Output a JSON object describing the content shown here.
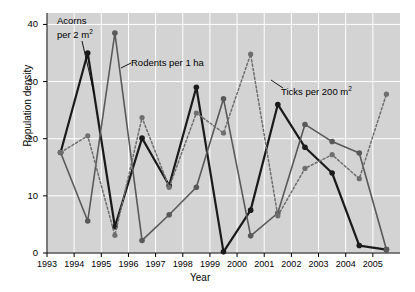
{
  "chart_data": {
    "type": "line",
    "title": "",
    "xlabel": "Year",
    "ylabel": "Population density",
    "xlim": [
      1993,
      2006
    ],
    "ylim": [
      0,
      42
    ],
    "yticks": [
      0,
      10,
      20,
      30,
      40
    ],
    "xticks": [
      1993,
      1994,
      1995,
      1996,
      1997,
      1998,
      1999,
      2000,
      2001,
      2002,
      2003,
      2004,
      2005
    ],
    "grid": true,
    "legend_position": "inline-annotations",
    "plot_background": "#d3d3d3",
    "x": [
      1993.5,
      1994.5,
      1995.5,
      1996.5,
      1997.5,
      1998.5,
      1999.5,
      2000.5,
      2001.5,
      2002.5,
      2003.5,
      2004.5,
      2005.5
    ],
    "series": [
      {
        "name": "Acorns per 2 m2",
        "label": "Acorns",
        "label_unit": "per 2 m",
        "label_exp": "2",
        "color": "#1a1a1a",
        "linestyle": "solid",
        "linewidth": 2.2,
        "marker": "circle",
        "values": [
          17.6,
          35.0,
          4.6,
          20.1,
          11.8,
          29.0,
          0.2,
          7.5,
          26.0,
          18.5,
          14.0,
          1.3,
          0.6
        ]
      },
      {
        "name": "Rodents per 1 ha",
        "label": "Rodents per 1 ha",
        "color": "#595959",
        "linestyle": "solid",
        "linewidth": 1.6,
        "marker": "circle",
        "values": [
          17.6,
          5.6,
          38.5,
          2.2,
          6.7,
          11.5,
          27.0,
          3.0,
          7.0,
          22.5,
          19.5,
          17.5,
          0.6
        ]
      },
      {
        "name": "Ticks per 200 m2",
        "label": "Ticks per 200 m",
        "label_exp": "2",
        "color": "#6e6e6e",
        "linestyle": "dashed",
        "linewidth": 1.5,
        "marker": "circle",
        "values": [
          17.6,
          20.5,
          3.1,
          23.7,
          11.5,
          24.5,
          21.0,
          34.8,
          6.5,
          14.8,
          17.2,
          13.0,
          27.8
        ]
      }
    ],
    "annotations": [
      {
        "id": "acorns",
        "text_line1": "Acorns",
        "text_line2": "per 2 m",
        "exp": "2"
      },
      {
        "id": "rodents",
        "text": "Rodents per 1 ha"
      },
      {
        "id": "ticks",
        "text": "Ticks per 200 m",
        "exp": "2"
      }
    ]
  },
  "axes": {
    "ylabel": "Population density",
    "xlabel": "Year",
    "ytick_labels": [
      "0",
      "10",
      "20",
      "30",
      "40"
    ],
    "xtick_labels": [
      "1993",
      "1994",
      "1995",
      "1996",
      "1997",
      "1998",
      "1999",
      "2000",
      "2001",
      "2002",
      "2003",
      "2004",
      "2005"
    ]
  }
}
